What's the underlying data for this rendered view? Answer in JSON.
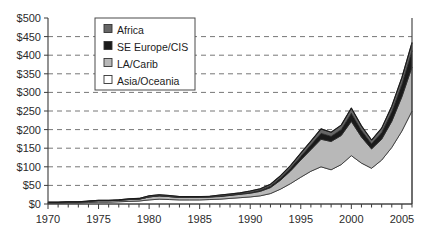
{
  "chart_data": {
    "type": "area",
    "stacked": true,
    "title": "",
    "subtitle": "",
    "xlabel": "",
    "ylabel": "",
    "xlim": [
      1970,
      2006
    ],
    "ylim": [
      0,
      500
    ],
    "ytick_step": 50,
    "grid": true,
    "grid_style": "dashed-horizontal",
    "legend_position": "top-center",
    "x": [
      1970,
      1971,
      1972,
      1973,
      1974,
      1975,
      1976,
      1977,
      1978,
      1979,
      1980,
      1981,
      1982,
      1983,
      1984,
      1985,
      1986,
      1987,
      1988,
      1989,
      1990,
      1991,
      1992,
      1993,
      1994,
      1995,
      1996,
      1997,
      1998,
      1999,
      2000,
      2001,
      2002,
      2003,
      2004,
      2005,
      2006
    ],
    "ytick_labels": [
      "$0",
      "$50",
      "$100",
      "$150",
      "$200",
      "$250",
      "$300",
      "$350",
      "$400",
      "$450",
      "$500"
    ],
    "ytick_values": [
      0,
      50,
      100,
      150,
      200,
      250,
      300,
      350,
      400,
      450,
      500
    ],
    "xtick_labels": [
      "1970",
      "1975",
      "1980",
      "1985",
      "1990",
      "1995",
      "2000",
      "2005"
    ],
    "xtick_values": [
      1970,
      1975,
      1980,
      1985,
      1990,
      1995,
      2000,
      2005
    ],
    "series": [
      {
        "name": "Asia/Oceania",
        "color": "#ffffff",
        "order": 1,
        "values": [
          2,
          2,
          3,
          3,
          4,
          5,
          5,
          6,
          7,
          8,
          11,
          13,
          12,
          11,
          11,
          11,
          12,
          13,
          15,
          17,
          19,
          22,
          28,
          40,
          55,
          72,
          88,
          100,
          92,
          106,
          130,
          110,
          96,
          118,
          152,
          196,
          250
        ]
      },
      {
        "name": "LA/Carib",
        "color": "#b8b8b8",
        "order": 2,
        "values": [
          2,
          2,
          2,
          2,
          3,
          4,
          4,
          4,
          5,
          5,
          8,
          9,
          8,
          7,
          7,
          7,
          7,
          7,
          8,
          9,
          10,
          12,
          16,
          24,
          34,
          46,
          58,
          74,
          76,
          78,
          92,
          70,
          52,
          56,
          70,
          92,
          118
        ]
      },
      {
        "name": "SE Europe/CIS",
        "color": "#1a1a1a",
        "order": 3,
        "values": [
          0,
          0,
          0,
          0,
          0,
          0,
          0,
          0,
          0,
          0,
          0,
          0,
          0,
          0,
          0,
          0,
          0,
          1,
          1,
          1,
          2,
          3,
          4,
          6,
          8,
          10,
          13,
          16,
          14,
          16,
          22,
          18,
          14,
          18,
          26,
          34,
          44
        ]
      },
      {
        "name": "Africa",
        "color": "#666666",
        "order": 4,
        "values": [
          1,
          1,
          1,
          1,
          1,
          1,
          1,
          1,
          2,
          2,
          3,
          3,
          3,
          2,
          2,
          2,
          2,
          3,
          3,
          3,
          4,
          4,
          5,
          6,
          7,
          9,
          10,
          12,
          11,
          12,
          14,
          12,
          10,
          12,
          15,
          18,
          22
        ]
      }
    ],
    "series_totals": [
      5,
      5,
      6,
      6,
      8,
      10,
      10,
      11,
      14,
      15,
      22,
      25,
      23,
      20,
      20,
      20,
      21,
      24,
      27,
      30,
      35,
      41,
      53,
      76,
      104,
      137,
      169,
      202,
      193,
      212,
      258,
      210,
      172,
      204,
      263,
      340,
      434
    ]
  },
  "legend": {
    "items": [
      {
        "label": "Africa",
        "swatch": "#666666"
      },
      {
        "label": "SE Europe/CIS",
        "swatch": "#1a1a1a"
      },
      {
        "label": "LA/Carib",
        "swatch": "#b8b8b8"
      },
      {
        "label": "Asia/Oceania",
        "swatch": "#ffffff"
      }
    ]
  }
}
